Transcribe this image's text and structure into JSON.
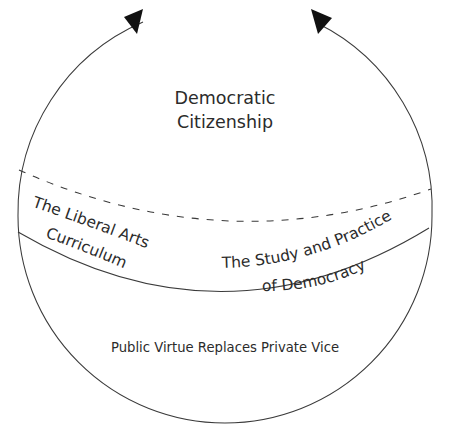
{
  "figure": {
    "title_line1": "Democratic",
    "title_line2": "Citizenship",
    "left_segment_line1": "The Liberal Arts",
    "left_segment_line2": "Curriculum",
    "right_segment_line1": "The Study and Practice",
    "right_segment_line2": "of Democracy",
    "bottom_band_label": "Public Virtue Replaces Private Vice",
    "caption": "",
    "colors": {
      "stroke": "#3a3a3a",
      "arrow_fill": "#111111",
      "text": "#2b2b2b",
      "background": "#ffffff"
    },
    "icons": {
      "left_arrow": "arrow-up-right-icon",
      "right_arrow": "arrow-up-left-icon"
    }
  }
}
